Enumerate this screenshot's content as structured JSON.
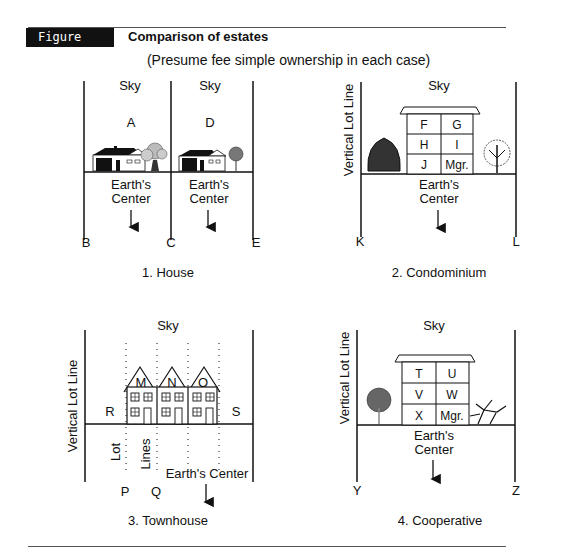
{
  "header": {
    "figure_label": "Figure 22.1",
    "title": "Comparison of estates",
    "subtitle": "(Presume fee simple ownership in each case)"
  },
  "panels": [
    {
      "caption": "1. House",
      "sky_labels": [
        "Sky",
        "Sky"
      ],
      "parcel_labels": [
        "A",
        "D"
      ],
      "earth_labels": [
        "Earth's",
        "Center",
        "Earth's",
        "Center"
      ],
      "corner_labels": [
        "B",
        "C",
        "E"
      ]
    },
    {
      "caption": "2. Condominium",
      "sky_label": "Sky",
      "side_label": "Vertical Lot Line",
      "units": [
        "F",
        "G",
        "H",
        "I",
        "J",
        "Mgr."
      ],
      "earth_label_1": "Earth's",
      "earth_label_2": "Center",
      "corner_labels": [
        "K",
        "L"
      ]
    },
    {
      "caption": "3. Townhouse",
      "sky_label": "Sky",
      "side_label": "Vertical Lot Line",
      "units": [
        "M",
        "N",
        "O"
      ],
      "side_parcels": [
        "R",
        "S"
      ],
      "lot_lines_label": [
        "Lot",
        "Lines"
      ],
      "earth_label": "Earth's Center",
      "corner_labels": [
        "P",
        "Q"
      ]
    },
    {
      "caption": "4. Cooperative",
      "sky_label": "Sky",
      "side_label": "Vertical Lot Line",
      "units": [
        "T",
        "U",
        "V",
        "W",
        "X",
        "Mgr."
      ],
      "earth_label_1": "Earth's",
      "earth_label_2": "Center",
      "corner_labels": [
        "Y",
        "Z"
      ]
    }
  ]
}
